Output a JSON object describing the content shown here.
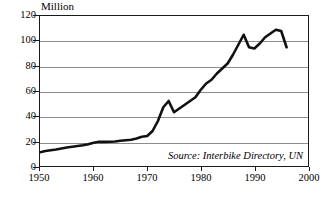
{
  "chart_data": {
    "type": "line",
    "title": "",
    "subtitle": "",
    "unit_label": "Million",
    "xlabel": "",
    "ylabel": "",
    "xlim": [
      1950,
      2000
    ],
    "ylim": [
      0,
      120
    ],
    "grid": true,
    "legend": null,
    "annotations": [
      {
        "name": "source",
        "text": "Source: Interbike Directory, UN",
        "style": "italic",
        "position": "inside-bottom-right"
      }
    ],
    "xticks": [
      1950,
      1960,
      1970,
      1980,
      1990,
      2000
    ],
    "xtick_labels": [
      "1950",
      "1960",
      "1970",
      "1980",
      "1990",
      "2000"
    ],
    "yticks": [
      0,
      20,
      40,
      60,
      80,
      100,
      120
    ],
    "ytick_labels": [
      "0",
      "20",
      "40",
      "60",
      "80",
      "100",
      "120"
    ],
    "series": [
      {
        "name": "World Bicycle Production",
        "color": "#111111",
        "x": [
          1950,
          1951,
          1952,
          1953,
          1954,
          1955,
          1956,
          1957,
          1958,
          1959,
          1960,
          1961,
          1962,
          1963,
          1964,
          1965,
          1966,
          1967,
          1968,
          1969,
          1970,
          1971,
          1972,
          1973,
          1974,
          1975,
          1976,
          1977,
          1978,
          1979,
          1980,
          1981,
          1982,
          1983,
          1984,
          1985,
          1986,
          1987,
          1988,
          1989,
          1990,
          1991,
          1992,
          1993,
          1994,
          1995,
          1996
        ],
        "values": [
          11,
          12,
          12.6,
          13.2,
          14,
          14.8,
          15.4,
          16,
          16.6,
          17.4,
          18.6,
          19.4,
          19.3,
          19.4,
          19.6,
          20.2,
          20.6,
          21,
          22,
          23.4,
          24,
          28,
          36,
          47,
          52,
          43,
          46,
          49,
          52,
          55,
          61,
          66,
          69,
          74,
          78,
          82,
          89,
          97,
          105,
          95,
          94,
          98,
          103,
          106,
          109,
          108,
          95
        ]
      }
    ]
  }
}
